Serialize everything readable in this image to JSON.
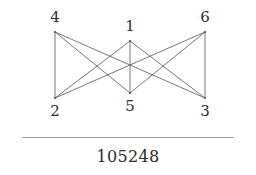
{
  "figure": {
    "caption": "105248",
    "rule_color": "#9a9a9a",
    "background": "#ffffff",
    "edge_color": "#555555",
    "label_color": "#2b2b2b"
  },
  "graph": {
    "type": "bipartite-graph",
    "description": "complete bipartite graph K3,3 drawn with three top vertices and three bottom vertices",
    "vertices": [
      {
        "id": "v4",
        "label": "4",
        "x": 55,
        "y": 32,
        "row": "top",
        "label_pos": "top"
      },
      {
        "id": "v1",
        "label": "1",
        "x": 130,
        "y": 41,
        "row": "top",
        "label_pos": "top"
      },
      {
        "id": "v6",
        "label": "6",
        "x": 205,
        "y": 32,
        "row": "top",
        "label_pos": "top"
      },
      {
        "id": "v2",
        "label": "2",
        "x": 55,
        "y": 98,
        "row": "bottom",
        "label_pos": "bottom"
      },
      {
        "id": "v5",
        "label": "5",
        "x": 130,
        "y": 93,
        "row": "bottom",
        "label_pos": "bottom"
      },
      {
        "id": "v3",
        "label": "3",
        "x": 205,
        "y": 98,
        "row": "bottom",
        "label_pos": "bottom"
      }
    ],
    "edges": [
      {
        "from": "v4",
        "to": "v2"
      },
      {
        "from": "v4",
        "to": "v5"
      },
      {
        "from": "v4",
        "to": "v3"
      },
      {
        "from": "v1",
        "to": "v2"
      },
      {
        "from": "v1",
        "to": "v5"
      },
      {
        "from": "v1",
        "to": "v3"
      },
      {
        "from": "v6",
        "to": "v2"
      },
      {
        "from": "v6",
        "to": "v5"
      },
      {
        "from": "v6",
        "to": "v3"
      }
    ]
  }
}
